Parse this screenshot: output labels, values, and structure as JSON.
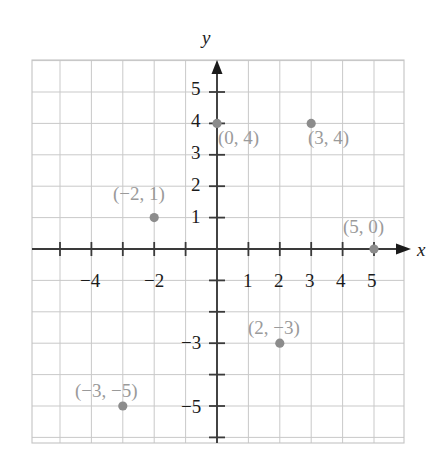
{
  "figure": {
    "kind": "coordinate-plane-scatter",
    "background_color": "#ffffff"
  },
  "chart_data": {
    "type": "scatter",
    "title": "",
    "subtitle": "",
    "xlabel": "x",
    "ylabel": "y",
    "xlim": [
      -5.9,
      5.9
    ],
    "ylim": [
      -6.2,
      6.0
    ],
    "grid": true,
    "grid_step": 1,
    "grid_color": "#c9c9c9",
    "axis_color": "#3a3a3a",
    "point_color": "#8c8c8c",
    "label_color": "#9a9a9a",
    "legend": "none",
    "x_ticks": [
      -4,
      -2,
      1,
      2,
      3,
      4,
      5
    ],
    "x_tick_labels": [
      "−4",
      "−2",
      "1",
      "2",
      "3",
      "4",
      "5"
    ],
    "y_ticks": [
      5,
      4,
      3,
      2,
      1,
      -3,
      -5
    ],
    "y_tick_labels": [
      "5",
      "4",
      "3",
      "2",
      "1",
      "−3",
      "−5"
    ],
    "x_minor_ticks": [
      -5,
      -4,
      -3,
      -2,
      -1,
      1,
      2,
      3,
      4,
      5
    ],
    "y_minor_ticks": [
      -6,
      -5,
      -4,
      -3,
      -2,
      -1,
      1,
      2,
      3,
      4,
      5
    ],
    "points": [
      {
        "label": "(0, 4)",
        "x": 0,
        "y": 4,
        "label_dx": 4,
        "label_dy": 22
      },
      {
        "label": "(3, 4)",
        "x": 3,
        "y": 4,
        "label_dx": 2,
        "label_dy": 22
      },
      {
        "label": "(−2, 1)",
        "x": -2,
        "y": 1,
        "label_dx": -48,
        "label_dy": -10
      },
      {
        "label": "(5, 0)",
        "x": 5,
        "y": 0,
        "label_dx": -30,
        "label_dy": -12
      },
      {
        "label": "(2, −3)",
        "x": 2,
        "y": -3,
        "label_dx": -6,
        "label_dy": -12
      },
      {
        "label": "(−3, −5)",
        "x": -3,
        "y": -5,
        "label_dx": -50,
        "label_dy": -12
      }
    ],
    "axis_label_x": "x",
    "axis_label_y": "y"
  },
  "labels": {
    "y_axis_name": "y",
    "x_axis_name": "x",
    "ticks_x": {
      "m4": "−4",
      "m2": "−2",
      "p1": "1",
      "p2": "2",
      "p3": "3",
      "p4": "4",
      "p5": "5"
    },
    "ticks_y": {
      "p5": "5",
      "p4": "4",
      "p3": "3",
      "p2": "2",
      "p1": "1",
      "m3": "−3",
      "m5": "−5"
    },
    "points": {
      "p0_4": "(0, 4)",
      "p3_4": "(3, 4)",
      "pm2_1": "(−2, 1)",
      "p5_0": "(5, 0)",
      "p2_m3": "(2, −3)",
      "pm3_m5": "(−3, −5)"
    }
  }
}
